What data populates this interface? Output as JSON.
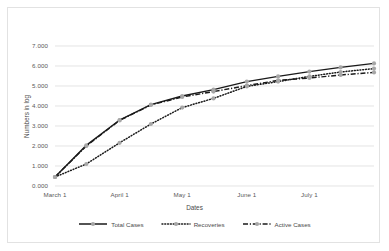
{
  "chart_data": {
    "type": "line",
    "title": "",
    "xlabel": "Dates",
    "ylabel": "Numbers in log",
    "grid": true,
    "legend_position": "bottom",
    "ylim": [
      0,
      7
    ],
    "yticks": [
      "0.000",
      "1.000",
      "2.000",
      "3.000",
      "4.000",
      "5.000",
      "6.000",
      "7.000"
    ],
    "xticks": [
      "March 1",
      "April 1",
      "May 1",
      "June 1",
      "July 1"
    ],
    "x": [
      0,
      15,
      31,
      46,
      61,
      76,
      92,
      107,
      122,
      137,
      153
    ],
    "x_labels": [
      "March 1",
      "March 16",
      "April 1",
      "April 16",
      "May 1",
      "May 16",
      "June 1",
      "June 16",
      "July 1",
      "July 16",
      "July 31"
    ],
    "series": [
      {
        "name": "Total Cases",
        "style": "solid",
        "marker": "circle",
        "color": "#1a1a1a",
        "marker_color": "#a6a6a6",
        "values": [
          0.45,
          2.03,
          3.3,
          4.07,
          4.5,
          4.82,
          5.22,
          5.48,
          5.72,
          5.93,
          6.13
        ]
      },
      {
        "name": "Recoveries",
        "style": "dotted",
        "marker": "circle",
        "color": "#1a1a1a",
        "marker_color": "#a6a6a6",
        "values": [
          0.45,
          1.1,
          2.16,
          3.1,
          3.92,
          4.38,
          4.98,
          5.22,
          5.48,
          5.7,
          5.87
        ]
      },
      {
        "name": "Active Cases",
        "style": "dashdot",
        "marker": "circle",
        "color": "#1a1a1a",
        "marker_color": "#a6a6a6",
        "values": [
          0.45,
          2.0,
          3.28,
          4.05,
          4.45,
          4.72,
          5.02,
          5.28,
          5.4,
          5.55,
          5.68
        ]
      }
    ]
  },
  "legend": {
    "items": [
      {
        "label": "Total Cases",
        "key": "solid-line-marker-key"
      },
      {
        "label": "Recoveries",
        "key": "dotted-line-marker-key"
      },
      {
        "label": "Active Cases",
        "key": "dashdot-line-marker-key"
      }
    ]
  },
  "colors": {
    "gridline": "#d9d9d9",
    "axis_text": "#5a5a5a",
    "series_line": "#1a1a1a",
    "marker": "#a6a6a6",
    "frame": "#e2e2e2"
  }
}
